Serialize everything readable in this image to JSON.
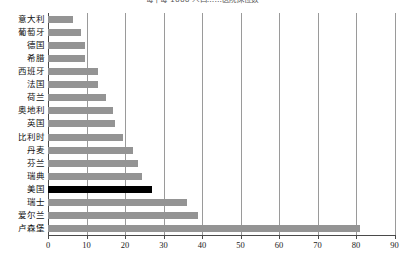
{
  "chart_data": {
    "type": "bar",
    "orientation": "horizontal",
    "title": "每千每 1000 人口……医院床位数",
    "xlabel": "",
    "ylabel": "",
    "xlim": [
      0,
      90
    ],
    "xticks": [
      0,
      10,
      20,
      30,
      40,
      50,
      60,
      70,
      80,
      90
    ],
    "grid": "vertical",
    "legend": "none",
    "categories": [
      "意大利",
      "葡萄牙",
      "德国",
      "希腊",
      "西班牙",
      "法国",
      "荷兰",
      "奥地利",
      "英国",
      "比利时",
      "丹麦",
      "芬兰",
      "瑞典",
      "美国",
      "瑞士",
      "爱尔兰",
      "卢森堡"
    ],
    "values": [
      6.5,
      8.5,
      9.5,
      9.5,
      13,
      13,
      15,
      17,
      17.5,
      19.5,
      22,
      23.5,
      24.5,
      27,
      36,
      39,
      81
    ],
    "highlight_category": "美国",
    "colors": {
      "bar": "#949494",
      "highlight_bar": "#000000",
      "gridline": "#9a9a9a",
      "axis": "#4a4a4a",
      "text": "#111111",
      "background": "#ffffff"
    }
  }
}
